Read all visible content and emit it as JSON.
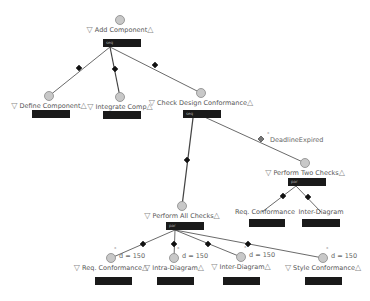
{
  "diagram": {
    "type": "process-tree",
    "nodes": [
      {
        "id": "add",
        "label": "Add Component",
        "x": 120,
        "y": 20,
        "bar": {
          "x": 103,
          "y": 39,
          "w": 38,
          "text": "seq"
        }
      },
      {
        "id": "define",
        "label": "Define Component",
        "x": 49,
        "y": 96,
        "bar": {
          "x": 32,
          "y": 110,
          "w": 38
        }
      },
      {
        "id": "integrate",
        "label": "Integrate Comp",
        "x": 120,
        "y": 97,
        "bar": {
          "x": 103,
          "y": 111,
          "w": 38
        }
      },
      {
        "id": "check",
        "label": "Check Design Conformance",
        "x": 201,
        "y": 93,
        "bar": {
          "x": 183,
          "y": 110,
          "w": 38,
          "text": "seq"
        }
      },
      {
        "id": "two",
        "label": "Perform Two Checks",
        "x": 305,
        "y": 163,
        "bar": {
          "x": 288,
          "y": 178,
          "w": 38,
          "text": "par"
        }
      },
      {
        "id": "req2",
        "label": "Req. Conformance",
        "x": 265,
        "y": 212,
        "bar": {
          "x": 249,
          "y": 219,
          "w": 36
        }
      },
      {
        "id": "inter2",
        "label": "Inter-Diagram",
        "x": 321,
        "y": 212,
        "bar": {
          "x": 302,
          "y": 219,
          "w": 38
        }
      },
      {
        "id": "all",
        "label": "Perform All Checks",
        "x": 182,
        "y": 206,
        "bar": {
          "x": 166,
          "y": 222,
          "w": 38,
          "text": "par"
        }
      },
      {
        "id": "req",
        "label": "Req. Conformance",
        "x": 111,
        "y": 258,
        "bar": {
          "x": 95,
          "y": 277,
          "w": 37
        },
        "annotation": "d = 150"
      },
      {
        "id": "intra",
        "label": "Intra-Diagram",
        "x": 174,
        "y": 258,
        "bar": {
          "x": 157,
          "y": 277,
          "w": 37
        },
        "annotation": "d = 150"
      },
      {
        "id": "inter",
        "label": "Inter-Diagram",
        "x": 241,
        "y": 257,
        "bar": {
          "x": 223,
          "y": 277,
          "w": 37
        },
        "annotation": "d = 150"
      },
      {
        "id": "style",
        "label": "Style Conformance",
        "x": 323,
        "y": 258,
        "bar": {
          "x": 305,
          "y": 277,
          "w": 37
        },
        "annotation": "d = 150"
      }
    ],
    "edges": [
      {
        "from": [
          110,
          47
        ],
        "to": [
          49,
          96
        ],
        "diamond": [
          79,
          68
        ]
      },
      {
        "from": [
          110,
          47
        ],
        "to": [
          120,
          97
        ],
        "diamond": [
          115,
          69
        ]
      },
      {
        "from": [
          110,
          47
        ],
        "to": [
          201,
          93
        ],
        "diamond": [
          155,
          65
        ]
      },
      {
        "from": [
          193,
          118
        ],
        "to": [
          182,
          206
        ],
        "diamond": [
          187,
          160
        ]
      },
      {
        "from": [
          200,
          115
        ],
        "to": [
          305,
          163
        ],
        "diamond": [
          261,
          139
        ],
        "hollow": true
      },
      {
        "from": [
          296,
          186
        ],
        "to": [
          262,
          212
        ],
        "diamond": [
          283,
          196
        ]
      },
      {
        "from": [
          296,
          186
        ],
        "to": [
          321,
          212
        ],
        "diamond": [
          308,
          197
        ]
      },
      {
        "from": [
          175,
          230
        ],
        "to": [
          111,
          258
        ],
        "diamond": [
          143,
          244
        ]
      },
      {
        "from": [
          175,
          230
        ],
        "to": [
          174,
          258
        ],
        "diamond": [
          174,
          244
        ]
      },
      {
        "from": [
          175,
          230
        ],
        "to": [
          241,
          257
        ],
        "diamond": [
          208,
          244
        ]
      },
      {
        "from": [
          175,
          230
        ],
        "to": [
          323,
          258
        ],
        "diamond": [
          248,
          244
        ]
      }
    ],
    "edge_labels": [
      {
        "text": "DeadlineExpired",
        "x": 270,
        "y": 136
      }
    ],
    "colors": {
      "line": "#444444",
      "circle_fill": "#c8c8c8",
      "circle_stroke": "#888888",
      "bar": "#1a1a1a",
      "text": "#555555"
    }
  }
}
